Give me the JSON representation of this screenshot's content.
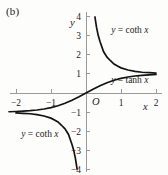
{
  "figure": {
    "panel_label": "(b)"
  },
  "chart_data": {
    "type": "line",
    "title": "",
    "xlabel": "x",
    "ylabel": "y",
    "origin_label": "O",
    "xlim": [
      -2.25,
      2.15
    ],
    "ylim": [
      -4.3,
      4.35
    ],
    "xticks": [
      -2,
      -1,
      1,
      2
    ],
    "xtick_labels": [
      "−2",
      "−1",
      "1",
      "2"
    ],
    "yticks": [
      4,
      3,
      2,
      1,
      -1,
      -2,
      -3,
      -4
    ],
    "ytick_labels": [
      "4",
      "3",
      "2",
      "1",
      "−1",
      "−2",
      "−3",
      "−4"
    ],
    "grid": false,
    "legend_position": "inline-annotations",
    "annotations": [
      {
        "name": "coth-upper-label",
        "text": "y = coth x",
        "x": 0.72,
        "y": 3.15
      },
      {
        "name": "tanh-label",
        "text": "y = tanh x",
        "x": 0.72,
        "y": 0.52
      },
      {
        "name": "coth-lower-label",
        "text": "y = coth x",
        "x": -1.85,
        "y": -2.28
      }
    ],
    "series": [
      {
        "name": "y = tanh x",
        "function": "tanh",
        "asymptotes": [
          1,
          -1
        ],
        "x": [
          -2.2,
          -2.0,
          -1.8,
          -1.6,
          -1.4,
          -1.2,
          -1.0,
          -0.8,
          -0.6,
          -0.4,
          -0.2,
          0.0,
          0.2,
          0.4,
          0.6,
          0.8,
          1.0,
          1.2,
          1.4,
          1.6,
          1.8,
          2.0
        ],
        "values": [
          -0.976,
          -0.964,
          -0.947,
          -0.922,
          -0.885,
          -0.834,
          -0.762,
          -0.664,
          -0.537,
          -0.38,
          -0.197,
          0.0,
          0.197,
          0.38,
          0.537,
          0.664,
          0.762,
          0.834,
          0.885,
          0.922,
          0.947,
          0.964
        ]
      },
      {
        "name": "y = coth x (positive branch)",
        "function": "coth",
        "branch": "positive",
        "x": [
          0.255,
          0.3,
          0.35,
          0.4,
          0.5,
          0.6,
          0.7,
          0.8,
          0.9,
          1.0,
          1.2,
          1.4,
          1.6,
          1.8,
          2.0
        ],
        "values": [
          3.96,
          3.43,
          2.99,
          2.68,
          2.16,
          1.87,
          1.68,
          1.51,
          1.41,
          1.31,
          1.2,
          1.13,
          1.08,
          1.06,
          1.04
        ]
      },
      {
        "name": "y = coth x (negative branch)",
        "function": "coth",
        "branch": "negative",
        "x": [
          -2.0,
          -1.8,
          -1.6,
          -1.4,
          -1.2,
          -1.0,
          -0.9,
          -0.8,
          -0.7,
          -0.6,
          -0.5,
          -0.4,
          -0.35,
          -0.3,
          -0.255
        ],
        "values": [
          -1.04,
          -1.06,
          -1.08,
          -1.13,
          -1.2,
          -1.31,
          -1.41,
          -1.51,
          -1.68,
          -1.87,
          -2.16,
          -2.68,
          -2.99,
          -3.43,
          -3.96
        ]
      }
    ]
  }
}
